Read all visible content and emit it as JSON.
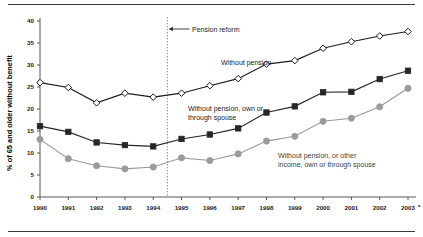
{
  "figure": {
    "ylabel": "% of 65 and older without benefit",
    "has_top_rule": true,
    "has_bottom_rule": true,
    "footnote_marker": "a"
  },
  "annotations": {
    "reform": "Pension reform",
    "series1": "Without pension",
    "series2_line1": "Without pension, own or",
    "series2_line2": "through spouse",
    "series3_line1": "Without pension, or other",
    "series3_line2": "income, own or through spouse"
  },
  "colors": {
    "series1": "#1a1a1a",
    "series2": "#262626",
    "series3": "#9a9a9a",
    "axis": "#595959",
    "reform_line": "#8a8a8a",
    "rule": "#3a3a3a"
  },
  "yticks": [
    "0",
    "5",
    "10",
    "15",
    "20",
    "25",
    "30",
    "35",
    "40"
  ],
  "xticks": [
    "1990",
    "1991",
    "1992",
    "1993",
    "1994",
    "1995",
    "1996",
    "1997",
    "1998",
    "1999",
    "2000",
    "2001",
    "2002",
    "2003"
  ],
  "chart_data": {
    "type": "line",
    "title": "",
    "xlabel": "",
    "ylabel": "% of 65 and older without benefit",
    "xlim": [
      "1990",
      "2003"
    ],
    "ylim": [
      0,
      40
    ],
    "ytick_step": 5,
    "grid": false,
    "legend": "inline-annotations",
    "categories": [
      "1990",
      "1991",
      "1992",
      "1993",
      "1994",
      "1995",
      "1996",
      "1997",
      "1998",
      "1999",
      "2000",
      "2001",
      "2002",
      "2003"
    ],
    "annotations_markers": [
      {
        "label": "Pension reform",
        "x": "1994.5",
        "type": "vertical-dotted-line-with-arrow"
      }
    ],
    "series": [
      {
        "name": "Without pension",
        "marker": "open-diamond",
        "color": "#1a1a1a",
        "values": [
          26.0,
          24.9,
          21.4,
          23.6,
          22.7,
          23.6,
          25.3,
          26.9,
          30.2,
          31.0,
          33.8,
          35.3,
          36.6,
          37.6
        ]
      },
      {
        "name": "Without pension, own or through spouse",
        "marker": "filled-square",
        "color": "#262626",
        "values": [
          16.1,
          14.8,
          12.4,
          11.8,
          11.5,
          13.2,
          14.2,
          15.6,
          19.2,
          20.6,
          23.8,
          23.9,
          26.8,
          28.7
        ]
      },
      {
        "name": "Without pension, or other income, own or through spouse",
        "marker": "filled-circle",
        "color": "#9a9a9a",
        "values": [
          13.1,
          8.7,
          7.1,
          6.4,
          6.8,
          8.9,
          8.3,
          9.8,
          12.7,
          13.8,
          17.2,
          17.9,
          20.5,
          24.7
        ]
      }
    ]
  }
}
